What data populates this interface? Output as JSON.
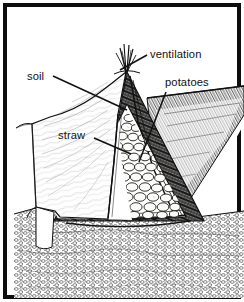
{
  "figure": {
    "kind": "line-art-cross-section-diagram",
    "background_color": "#ffffff",
    "ink_color": "#111111",
    "frame": {
      "border_color": "#0d0d0d",
      "border_width_px": 4,
      "outer_margin_px": 3
    }
  },
  "labels": [
    {
      "id": "soil",
      "text": "soil",
      "x": 13,
      "y": 66,
      "anchor": "start",
      "leader": {
        "x1": 39,
        "y1": 62,
        "x2": 113,
        "y2": 96
      }
    },
    {
      "id": "ventilation",
      "text": "ventilation",
      "x": 136,
      "y": 44,
      "anchor": "start",
      "leader": {
        "x1": 133,
        "y1": 41,
        "x2": 106,
        "y2": 56
      }
    },
    {
      "id": "potatoes",
      "text": "potatoes",
      "x": 151,
      "y": 72,
      "anchor": "start",
      "leader": {
        "x1": 152,
        "y1": 78,
        "x2": 125,
        "y2": 148
      }
    },
    {
      "id": "straw",
      "text": "straw",
      "x": 44,
      "y": 125,
      "anchor": "start",
      "leader": {
        "x1": 80,
        "y1": 124,
        "x2": 117,
        "y2": 140
      }
    }
  ],
  "scene_parts": [
    {
      "id": "soil-mound",
      "description": "light soil covering mound on left with fine contour shading"
    },
    {
      "id": "ventilation-tuft",
      "description": "tuft of straw protruding from the apex of the mound"
    },
    {
      "id": "straw-layer",
      "description": "dark hatched straw insulation layer forming a triangle"
    },
    {
      "id": "potato-pile",
      "description": "triangular pile of pale oval potatoes inside the straw"
    },
    {
      "id": "ground",
      "description": "stippled pebbly ground beneath and beside the clamp"
    },
    {
      "id": "cut-bank-right",
      "description": "hatched cut-away soil bank on the right"
    }
  ]
}
